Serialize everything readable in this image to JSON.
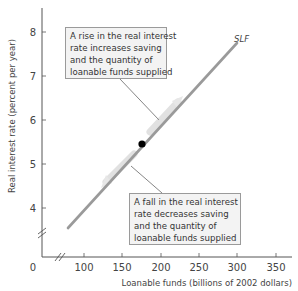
{
  "chart_data": {
    "type": "line",
    "title": "",
    "xlabel": "Loanable funds (billions of 2002 dollars)",
    "ylabel": "Real interest rate (percent per year)",
    "x_ticks": [
      "0",
      "100",
      "150",
      "200",
      "250",
      "300",
      "350"
    ],
    "y_ticks": [
      "4",
      "5",
      "6",
      "7",
      "8"
    ],
    "xlim": [
      0,
      370
    ],
    "ylim": [
      3,
      8.5
    ],
    "axis_breaks": {
      "x": true,
      "y": true
    },
    "grid": false,
    "series": [
      {
        "name": "SLF",
        "x": [
          80,
          300
        ],
        "y": [
          3.6,
          7.75
        ]
      }
    ],
    "points": [
      {
        "x": 175,
        "y": 5.45,
        "label": ""
      }
    ],
    "annotations": [
      {
        "text": "A rise in the real interest rate increases saving and the quantity of loanable funds supplied",
        "points_to": "upward movement along SLF"
      },
      {
        "text": "A fall in the real interest rate decreases saving and the quantity of loanable funds supplied",
        "points_to": "downward movement along SLF"
      }
    ]
  },
  "labels": {
    "curve": "SLF",
    "x_axis": "Loanable funds (billions of 2002 dollars)",
    "y_axis": "Real interest rate (percent per year)",
    "origin": "0"
  },
  "notes": {
    "rise": [
      "A rise in the real interest",
      "rate increases saving",
      "and the quantity of",
      "loanable funds supplied"
    ],
    "fall": [
      "A fall in the real interest",
      "rate decreases saving",
      "and the quantity of",
      "loanable funds supplied"
    ]
  },
  "ticks": {
    "x": [
      {
        "label": "100",
        "px": 84
      },
      {
        "label": "150",
        "px": 122
      },
      {
        "label": "200",
        "px": 161
      },
      {
        "label": "250",
        "px": 199
      },
      {
        "label": "300",
        "px": 237
      },
      {
        "label": "350",
        "px": 276
      }
    ],
    "y": [
      {
        "label": "8",
        "py": 32
      },
      {
        "label": "7",
        "py": 76
      },
      {
        "label": "6",
        "py": 120
      },
      {
        "label": "5",
        "py": 164
      },
      {
        "label": "4",
        "py": 208
      }
    ]
  },
  "colors": {
    "curve": "#9a9a9a",
    "axis": "#555555",
    "point": "#000000",
    "note_bg": "#f3f3f3"
  }
}
